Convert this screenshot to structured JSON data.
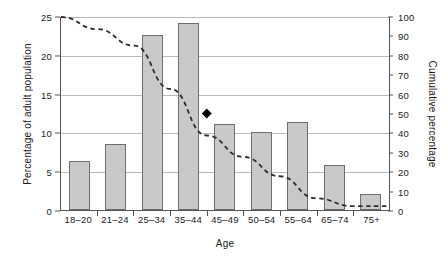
{
  "chart_data": {
    "type": "bar",
    "title": "",
    "xlabel": "Age",
    "ylabel": "Percentage of adult population",
    "y2label": "Cumulative percentage",
    "categories": [
      "18–20",
      "21–24",
      "25–34",
      "35–44",
      "45–49",
      "50–54",
      "55–64",
      "65–74",
      "75+"
    ],
    "values": [
      6.3,
      8.5,
      22.5,
      24.1,
      11.1,
      10.0,
      11.4,
      5.8,
      2.0
    ],
    "ylim": [
      0,
      25
    ],
    "yticks": [
      0,
      5,
      10,
      15,
      20,
      25
    ],
    "y2lim": [
      0,
      100
    ],
    "y2ticks": [
      0,
      10,
      20,
      30,
      40,
      50,
      60,
      70,
      80,
      90,
      100
    ],
    "grid": true,
    "legend": "none",
    "series": [
      {
        "name": "Percentage of adult population",
        "type": "bar",
        "axis": "left",
        "values": [
          6.3,
          8.5,
          22.5,
          24.1,
          11.1,
          10.0,
          11.4,
          5.8,
          2.0
        ],
        "fill_color": "#c9c9c9",
        "border_color": "#6e6e6e"
      },
      {
        "name": "Cumulative percentage",
        "type": "line",
        "axis": "right",
        "style": "dashed",
        "color": "#2b2b2b",
        "values": [
          100.0,
          93.7,
          85.2,
          62.7,
          38.6,
          27.5,
          17.5,
          6.1,
          2.0
        ],
        "marker": {
          "name": "median-marker",
          "shape": "diamond",
          "category": "45–49",
          "cumulative_value": 50,
          "color": "#000000"
        }
      }
    ]
  },
  "axes": {
    "left_ticks": [
      "0",
      "5",
      "10",
      "15",
      "20",
      "25"
    ],
    "right_ticks": [
      "0",
      "10",
      "20",
      "30",
      "40",
      "50",
      "60",
      "70",
      "80",
      "90",
      "100"
    ]
  }
}
